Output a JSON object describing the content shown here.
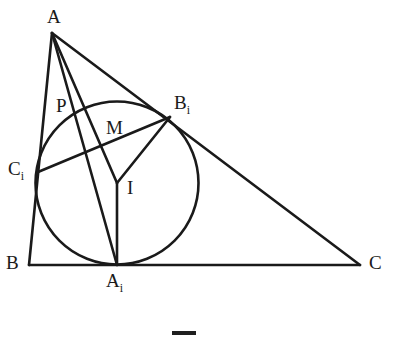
{
  "figure": {
    "type": "euclidean-geometry-diagram",
    "width": 393,
    "height": 337,
    "background_color": "#ffffff",
    "stroke_color": "#1a1a1a",
    "stroke_width": 2.6
  },
  "labels": {
    "A": {
      "text": "A",
      "sub": "",
      "x": 47,
      "y": 7
    },
    "B": {
      "text": "B",
      "sub": "",
      "x": 6,
      "y": 253
    },
    "C": {
      "text": "C",
      "sub": "",
      "x": 369,
      "y": 253
    },
    "A_i": {
      "text": "A",
      "sub": "i",
      "x": 106,
      "y": 271
    },
    "B_i": {
      "text": "B",
      "sub": "i",
      "x": 174,
      "y": 93
    },
    "C_i": {
      "text": "C",
      "sub": "i",
      "x": 8,
      "y": 159
    },
    "P": {
      "text": "P",
      "sub": "",
      "x": 56,
      "y": 96
    },
    "M": {
      "text": "M",
      "sub": "",
      "x": 106,
      "y": 118
    },
    "I": {
      "text": "I",
      "sub": "",
      "x": 127,
      "y": 178
    }
  },
  "points": {
    "A": {
      "x": 52,
      "y": 33
    },
    "B": {
      "x": 29,
      "y": 265
    },
    "C": {
      "x": 360,
      "y": 265
    },
    "A_i": {
      "x": 117,
      "y": 265
    },
    "B_i": {
      "x": 170,
      "y": 117
    },
    "C_i": {
      "x": 38,
      "y": 172
    },
    "P": {
      "x": 75,
      "y": 113
    },
    "M": {
      "x": 103,
      "y": 137
    },
    "I": {
      "x": 117,
      "y": 183
    }
  },
  "incircle": {
    "center_x": 117,
    "center_y": 183,
    "radius": 81.5
  },
  "segments": [
    {
      "name": "side-AB",
      "from": "A",
      "to": "B"
    },
    {
      "name": "side-BC",
      "from": "B",
      "to": "C"
    },
    {
      "name": "side-AC",
      "from": "A",
      "to": "C"
    },
    {
      "name": "cevian-A-Ai",
      "from": "A",
      "to": "A_i"
    },
    {
      "name": "cevian-A-I",
      "from": "A",
      "to": "I"
    },
    {
      "name": "chord-Ci-Bi",
      "from": "C_i",
      "to": "B_i"
    },
    {
      "name": "radius-I-Bi",
      "from": "I",
      "to": "B_i"
    },
    {
      "name": "radius-I-Ai",
      "from": "I",
      "to": "A_i"
    }
  ],
  "bottom_marker": {
    "name": "page-rule",
    "x": 172,
    "y": 331,
    "width": 24,
    "height": 4,
    "color": "#1f1f1f"
  }
}
